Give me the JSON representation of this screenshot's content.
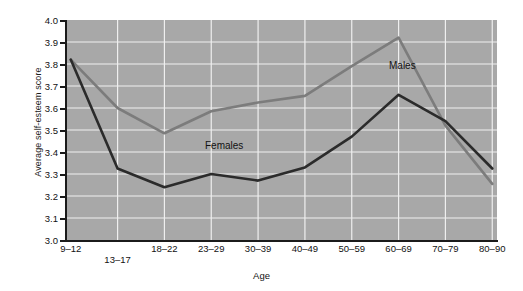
{
  "chart_data": {
    "type": "line",
    "title": "",
    "xlabel": "Age",
    "ylabel": "Average self-esteem score",
    "categories": [
      "9–12",
      "13–17",
      "18–22",
      "23–29",
      "30–39",
      "40–49",
      "50–59",
      "60–69",
      "70–79",
      "80–90"
    ],
    "ylim": [
      3.0,
      4.0
    ],
    "yticks": [
      "3.0",
      "3.1",
      "3.2",
      "3.3",
      "3.4",
      "3.5",
      "3.6",
      "3.7",
      "3.8",
      "3.9",
      "4.0"
    ],
    "grid": true,
    "legend_position": "inline-annotation",
    "series": [
      {
        "name": "Males",
        "color": "#7c7c7c",
        "values": [
          3.82,
          3.6,
          3.485,
          3.585,
          3.625,
          3.655,
          3.79,
          3.92,
          3.52,
          3.255
        ]
      },
      {
        "name": "Females",
        "color": "#2b2b2b",
        "values": [
          3.82,
          3.325,
          3.24,
          3.3,
          3.27,
          3.33,
          3.47,
          3.66,
          3.54,
          3.325
        ]
      }
    ],
    "annotations": [
      {
        "text": "Males",
        "x_px": 389,
        "y_px": 60
      },
      {
        "text": "Females",
        "x_px": 205,
        "y_px": 140
      }
    ]
  },
  "plot_style": {
    "plot_background": "#a8a8a8",
    "gridline_color": "#efefef",
    "axis_color": "#1b1b1b",
    "page_background": "#ffffff"
  }
}
